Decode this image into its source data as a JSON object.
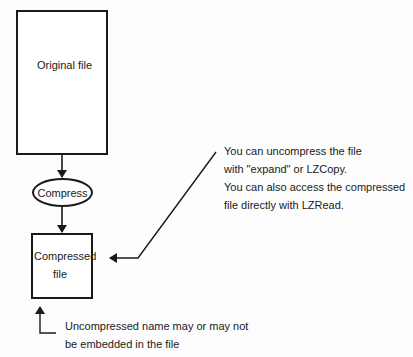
{
  "diagram": {
    "nodes": {
      "original": {
        "label": "Original file"
      },
      "compress": {
        "label": "Compress"
      },
      "compressed": {
        "line1": "Compressed",
        "line2": "file"
      }
    },
    "notes": {
      "access": [
        "You can uncompress the file",
        "with \"expand\" or LZCopy.",
        "You can also access the compressed",
        "file directly with LZRead."
      ],
      "name": [
        "Uncompressed name may or may not",
        "be embedded in the file"
      ]
    },
    "colors": {
      "stroke": "#1a1a1a",
      "background": "#fdfdfd"
    }
  }
}
